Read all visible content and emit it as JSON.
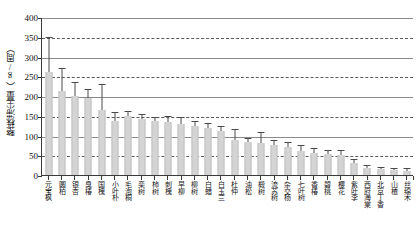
{
  "chart_data": {
    "type": "bar",
    "title": "",
    "xlabel": "",
    "ylabel": "整株滞尘量（g/周）",
    "ylim": [
      0,
      400
    ],
    "ytick_labels": [
      "0",
      "50",
      "100",
      "150",
      "200",
      "250",
      "300",
      "350",
      "400"
    ],
    "ytick_values": [
      0,
      50,
      100,
      150,
      200,
      250,
      300,
      350,
      400
    ],
    "grid": true,
    "legend": "none",
    "error_bars": "std",
    "categories": [
      "元宝枫",
      "圆柏",
      "银杏",
      "臭椿",
      "国槐",
      "小叶朴",
      "毛泡桐",
      "栾树",
      "柿树",
      "刺槐",
      "早柳",
      "柳树",
      "白蜡",
      "白玉兰",
      "杜仲",
      "油松",
      "椴树",
      "流苏树",
      "杂交杨",
      "七叶树",
      "香椿",
      "碧桃",
      "樱花",
      "紫叶李",
      "西府海棠",
      "北京丁香",
      "山楂",
      "丝绵木"
    ],
    "values": [
      262,
      213,
      200,
      194,
      165,
      137,
      150,
      141,
      136,
      134,
      130,
      124,
      119,
      112,
      88,
      83,
      80,
      75,
      72,
      62,
      56,
      52,
      51,
      30,
      18,
      14,
      12,
      10
    ],
    "errors": [
      86,
      55,
      32,
      22,
      62,
      20,
      10,
      11,
      8,
      12,
      14,
      10,
      9,
      10,
      27,
      9,
      26,
      12,
      10,
      11,
      10,
      9,
      9,
      8,
      5,
      4,
      4,
      4
    ]
  }
}
